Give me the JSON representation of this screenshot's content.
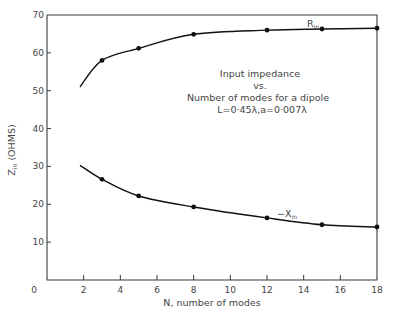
{
  "chart_data": {
    "type": "line",
    "title": "Input impedance vs. Number of modes for a dipole L=0·45λ,a=0·007λ",
    "annotation_lines": [
      "Input impedance",
      "vs.",
      "Number of modes for a dipole",
      "L=0·45λ,a=0·007λ"
    ],
    "xlabel": "N, number of modes",
    "ylabel": "Z_in (OHMS)",
    "ylabel_main": "Z",
    "ylabel_sub": "in",
    "ylabel_unit": "(OHMS)",
    "xlim": [
      0,
      18
    ],
    "ylim": [
      0,
      70
    ],
    "x_ticks": [
      0,
      2,
      4,
      6,
      8,
      10,
      12,
      14,
      16,
      18
    ],
    "x_tick_labels": [
      "0",
      "2",
      "4",
      "6",
      "8",
      "10",
      "12",
      "14",
      "16",
      "18"
    ],
    "y_ticks": [
      0,
      10,
      20,
      30,
      40,
      50,
      60,
      70
    ],
    "y_tick_labels": [
      "",
      "10",
      "20",
      "30",
      "40",
      "50",
      "60",
      "70"
    ],
    "grid": false,
    "legend": "inline labels on curves",
    "series": [
      {
        "name": "R_in",
        "label_main": "R",
        "label_sub": "in",
        "label_prefix": "",
        "x": [
          3,
          5,
          8,
          12,
          15,
          18
        ],
        "values": [
          58.0,
          61.2,
          64.9,
          66.0,
          66.3,
          66.5
        ],
        "curve_start": [
          1.8,
          51.0
        ]
      },
      {
        "name": "-X_in",
        "label_main": "X",
        "label_sub": "in",
        "label_prefix": "−",
        "x": [
          3,
          5,
          8,
          12,
          15,
          18
        ],
        "values": [
          26.6,
          22.2,
          19.3,
          16.4,
          14.6,
          14.0
        ],
        "curve_start": [
          1.8,
          30.3
        ]
      }
    ]
  }
}
